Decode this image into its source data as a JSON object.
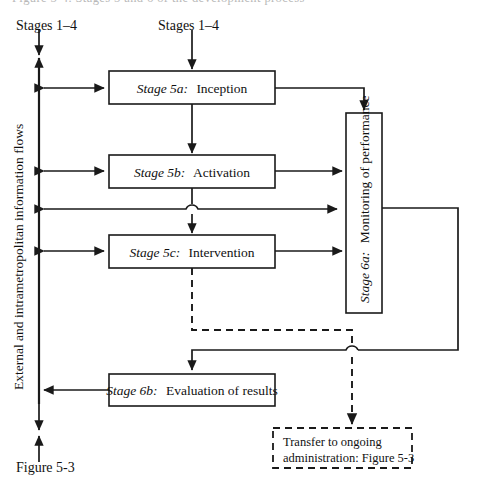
{
  "figure": {
    "id": "figure-5-4",
    "title_fragment_cropped": "Figure 5-4.  Stages 5 and 6 of the development process",
    "inputs": {
      "left_input_label": "Stages 1–4",
      "top_input_label": "Stages 1–4"
    },
    "side_axis_label": "External and intrametropolitan information flows",
    "bottom_reference_label": "Figure 5-3",
    "boxes": [
      {
        "name": "stage-5a",
        "stage": "Stage 5a:",
        "text": "Inception",
        "style": "solid",
        "orientation": "horizontal"
      },
      {
        "name": "stage-5b",
        "stage": "Stage 5b:",
        "text": "Activation",
        "style": "solid",
        "orientation": "horizontal"
      },
      {
        "name": "stage-5c",
        "stage": "Stage 5c:",
        "text": "Intervention",
        "style": "solid",
        "orientation": "horizontal"
      },
      {
        "name": "stage-6a",
        "stage": "Stage 6a:",
        "text": "Monitoring of performance",
        "style": "solid",
        "orientation": "vertical"
      },
      {
        "name": "stage-6b",
        "stage": "Stage 6b:",
        "text": "Evaluation of results",
        "style": "solid",
        "orientation": "horizontal"
      },
      {
        "name": "transfer-note",
        "stage": "",
        "text_line_1": "Transfer to ongoing",
        "text_line_2": "administration: Figure 5-3",
        "style": "dashed",
        "orientation": "horizontal"
      }
    ],
    "colors": {
      "ink": "#1a1a1a",
      "paper": "#ffffff"
    }
  }
}
